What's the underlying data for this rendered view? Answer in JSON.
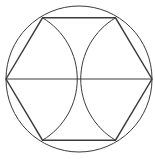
{
  "diagram": {
    "stroke_color": "#3a3a3a",
    "background": "#ffffff",
    "circle": {
      "cx": 79,
      "cy": 79,
      "r": 73
    },
    "hexagon_vertices": [
      {
        "name": "left",
        "x": 6,
        "y": 79
      },
      {
        "name": "top-left",
        "x": 42.5,
        "y": 17.8
      },
      {
        "name": "top-right",
        "x": 115.5,
        "y": 17.8
      },
      {
        "name": "right",
        "x": 152,
        "y": 79
      },
      {
        "name": "bottom-right",
        "x": 115.5,
        "y": 140.2
      },
      {
        "name": "bottom-left",
        "x": 42.5,
        "y": 140.2
      }
    ],
    "diameter": {
      "x1": 6,
      "y1": 79,
      "x2": 152,
      "y2": 79
    },
    "arcs": [
      {
        "name": "left-arc",
        "center": "left",
        "from": "top-left",
        "to": "bottom-left",
        "through": "center"
      },
      {
        "name": "right-arc",
        "center": "right",
        "from": "top-right",
        "to": "bottom-right",
        "through": "center"
      }
    ]
  }
}
